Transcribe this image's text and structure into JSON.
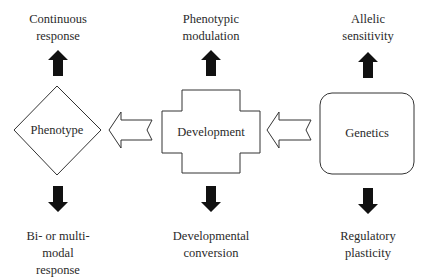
{
  "diagram": {
    "nodes": {
      "phenotype": {
        "label": "Phenotype",
        "shape": "diamond"
      },
      "development": {
        "label": "Development",
        "shape": "cross"
      },
      "genetics": {
        "label": "Genetics",
        "shape": "rounded-rectangle"
      }
    },
    "flows": [
      {
        "from": "genetics",
        "to": "development",
        "style": "hollow-arrow"
      },
      {
        "from": "development",
        "to": "phenotype",
        "style": "hollow-arrow"
      }
    ],
    "outputs": {
      "phenotype_up": {
        "line1": "Continuous",
        "line2": "response"
      },
      "phenotype_down": {
        "line1": "Bi- or multi-",
        "line2": "modal",
        "line3": "response"
      },
      "development_up": {
        "line1": "Phenotypic",
        "line2": "modulation"
      },
      "development_down": {
        "line1": "Developmental",
        "line2": "conversion"
      },
      "genetics_up": {
        "line1": "Allelic",
        "line2": "sensitivity"
      },
      "genetics_down": {
        "line1": "Regulatory",
        "line2": "plasticity"
      }
    },
    "colors": {
      "stroke": "#333333",
      "arrow_fill": "#111111",
      "background": "#ffffff"
    }
  }
}
